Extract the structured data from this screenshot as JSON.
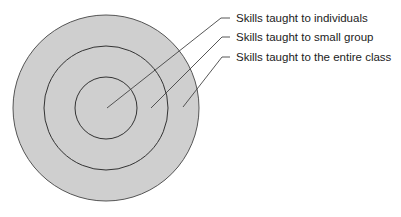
{
  "diagram": {
    "type": "concentric-circles",
    "center": [
      106,
      108
    ],
    "rings": [
      {
        "id": "entire-class",
        "radius": 93
      },
      {
        "id": "small-group",
        "radius": 62
      },
      {
        "id": "individuals",
        "radius": 31
      }
    ],
    "fill_color": "#cfcfcf",
    "stroke_color": "#4a4a4a",
    "labels": [
      {
        "text": "Skills taught to individuals",
        "target": "individuals"
      },
      {
        "text": "Skills taught to small group",
        "target": "small-group"
      },
      {
        "text": "Skills taught to the entire class",
        "target": "entire-class"
      }
    ]
  }
}
